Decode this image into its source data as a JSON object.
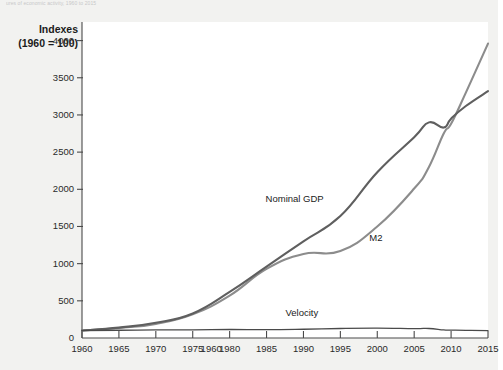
{
  "caption_remnant": "ures of economic activity, 1960 to 2015",
  "axis_title": {
    "line1": "Indexes",
    "line2": "(1960 = 100)"
  },
  "colors": {
    "background": "#f2f2f0",
    "plot_background": "#ffffff",
    "axis": "#4a4a4a",
    "nominal_gdp": "#5f5f5f",
    "m2": "#8c8c8c",
    "velocity": "#4a4a4a",
    "text": "#1b1b1b"
  },
  "chart_data": {
    "type": "line",
    "title": "",
    "xlabel": "",
    "ylabel": "Indexes (1960 = 100)",
    "xlim": [
      1960,
      2015
    ],
    "ylim": [
      0,
      4250
    ],
    "yticks": [
      0,
      500,
      1000,
      1500,
      2000,
      2500,
      3000,
      3500,
      4000
    ],
    "ytick_labels": [
      "0",
      "500",
      "1000",
      "1500",
      "2000",
      "2500",
      "3000",
      "3500",
      "4000"
    ],
    "xticks": [
      1960,
      1965,
      1970,
      1975,
      1980,
      1985,
      1990,
      1995,
      2000,
      2005,
      2010,
      2015
    ],
    "xtick_labels": [
      "1960",
      "1965",
      "1970",
      "1975",
      "1960",
      "1980",
      "1985",
      "1990",
      "1995",
      "2000",
      "2005",
      "2010",
      "2015"
    ],
    "grid": false,
    "legend_position": "inline-annotations",
    "annotations": [
      {
        "text": "Nominal GDP",
        "x": 1993,
        "y": 1870
      },
      {
        "text": "M2",
        "x": 2000,
        "y": 1340
      },
      {
        "text": "Velocity",
        "x": 1990,
        "y": 330
      }
    ],
    "x": [
      1960,
      1965,
      1970,
      1975,
      1980,
      1985,
      1990,
      1995,
      2000,
      2005,
      2007,
      2009,
      2010,
      2012,
      2015
    ],
    "series": [
      {
        "name": "Nominal GDP",
        "values": [
          100,
          140,
          205,
          330,
          620,
          960,
          1300,
          1640,
          2230,
          2700,
          2900,
          2830,
          2950,
          3120,
          3320
        ]
      },
      {
        "name": "M2",
        "values": [
          100,
          135,
          190,
          320,
          570,
          930,
          1130,
          1170,
          1500,
          2010,
          2300,
          2750,
          2880,
          3300,
          3960
        ]
      },
      {
        "name": "Velocity",
        "values": [
          100,
          104,
          108,
          110,
          114,
          112,
          118,
          128,
          132,
          126,
          128,
          108,
          106,
          102,
          100
        ]
      }
    ]
  }
}
